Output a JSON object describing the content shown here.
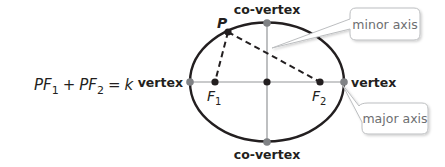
{
  "equation": {
    "lhs_1": "PF",
    "sub_1": "1",
    "plus": "+",
    "lhs_2": "PF",
    "sub_2": "2",
    "equals": "=",
    "rhs": "k"
  },
  "labels": {
    "point_p": "P",
    "focus_1": "F",
    "focus_1_sub": "1",
    "focus_2": "F",
    "focus_2_sub": "2",
    "vertex_left": "vertex",
    "vertex_right": "vertex",
    "covertex_top": "co-vertex",
    "covertex_bottom": "co-vertex"
  },
  "callouts": {
    "minor_axis": "minor axis",
    "major_axis": "major axis"
  },
  "colors": {
    "ellipse_stroke": "#231f20",
    "axis_line": "#939598",
    "vertex_dot": "#808285",
    "focus_dot": "#231f20",
    "callout_border": "#bcbec0",
    "callout_text": "#6d6e71"
  }
}
